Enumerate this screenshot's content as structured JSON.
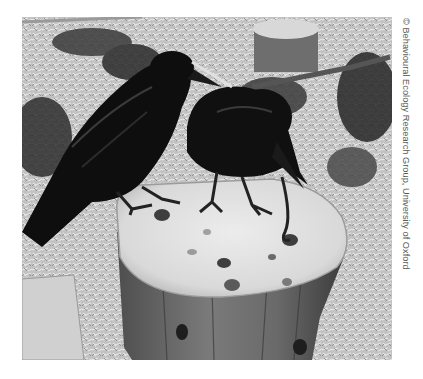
{
  "image": {
    "description": "Black-and-white photograph of two crows perched on a tree stump with holes drilled in the top; one crow holds a hooked stick tool probing a hole",
    "subjects": [
      "crow-left",
      "crow-right",
      "tree-stump",
      "hooked-stick-tool",
      "small-stump-background",
      "wood-chip-ground",
      "foliage"
    ]
  },
  "credit": {
    "text": "© Behavioural Ecology Research Group, University of Oxford"
  },
  "colors": {
    "background": "#ffffff",
    "credit_text": "#5a5a5a",
    "crow": "#0e0e0e",
    "stump_top": "#e2e2e2",
    "stump_bark": "#6a6a6a",
    "ground": "#bdbdbd"
  }
}
